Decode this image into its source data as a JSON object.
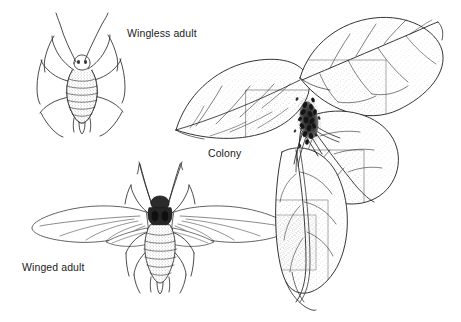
{
  "figure": {
    "background_color": "#ffffff",
    "ink_color": "#1b1b1b",
    "width": 461,
    "height": 322
  },
  "labels": {
    "wingless_adult": "Wingless adult",
    "colony": "Colony",
    "winged_adult": "Winged adult"
  },
  "illustrations": [
    {
      "name": "wingless-adult-aphid",
      "label": "Wingless adult",
      "description": "Dorsal view line drawing of a wingless aphid with segmented abdomen, two long antennae, six legs and a pair of cornicles"
    },
    {
      "name": "winged-adult-aphid",
      "label": "Winged adult",
      "description": "Dorsal view line drawing of a winged aphid with two pairs of outspread veined wings, dark head and thorax, segmented abdomen, long antennae and six legs"
    },
    {
      "name": "aphid-colony-on-plant",
      "label": "Colony",
      "description": "Stippled line drawing of a plant shoot with four heart-shaped leaves and a dense dark cluster of aphids massed at the leaf axis on the stem"
    }
  ]
}
